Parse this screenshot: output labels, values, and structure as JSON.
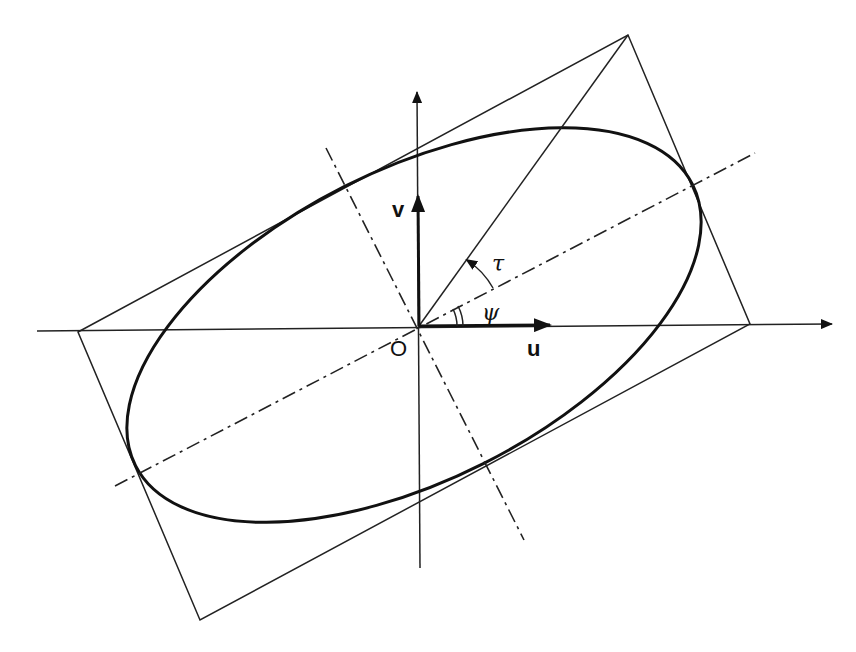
{
  "diagram": {
    "labels": {
      "origin": "O",
      "u_axis": "u",
      "v_axis": "v",
      "tau": "τ",
      "psi": "ψ"
    },
    "colors": {
      "line": "#222222",
      "background": "#ffffff"
    },
    "elements": [
      "horizontal axis with arrow",
      "vertical axis with arrow",
      "ellipse tilted by angle psi",
      "bounding rectangle tangent to ellipse",
      "major axis (dash-dot)",
      "minor axis (dash-dot)",
      "diagonal from origin to rectangle corner",
      "bold unit vector u",
      "bold unit vector v",
      "angle arc tau (arrow)",
      "double angle arc psi"
    ]
  }
}
